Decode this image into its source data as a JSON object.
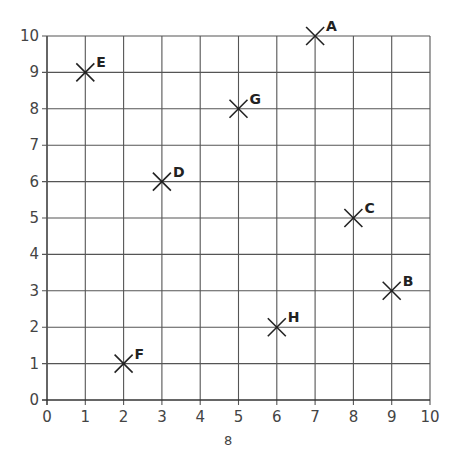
{
  "chart_data": {
    "type": "scatter",
    "title": "",
    "xlabel": "",
    "ylabel": "",
    "xlim": [
      0,
      10
    ],
    "ylim": [
      0,
      10
    ],
    "grid": true,
    "x_ticks": [
      "0",
      "1",
      "2",
      "3",
      "4",
      "5",
      "6",
      "7",
      "8",
      "9",
      "10"
    ],
    "y_ticks": [
      "0",
      "1",
      "2",
      "3",
      "4",
      "5",
      "6",
      "7",
      "8",
      "9",
      "10"
    ],
    "marker": "cross",
    "points": [
      {
        "label": "A",
        "x": 7,
        "y": 10
      },
      {
        "label": "B",
        "x": 9,
        "y": 3
      },
      {
        "label": "C",
        "x": 8,
        "y": 5
      },
      {
        "label": "D",
        "x": 3,
        "y": 6
      },
      {
        "label": "E",
        "x": 1,
        "y": 9
      },
      {
        "label": "F",
        "x": 2,
        "y": 1
      },
      {
        "label": "G",
        "x": 5,
        "y": 8
      },
      {
        "label": "H",
        "x": 6,
        "y": 2
      }
    ]
  },
  "footer": {
    "glyph": "8"
  },
  "colors": {
    "grid": "#555555",
    "marker": "#222222",
    "text": "#444444"
  }
}
